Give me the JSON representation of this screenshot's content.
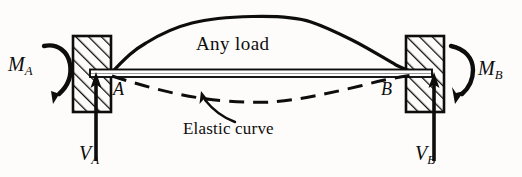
{
  "figure": {
    "ink_color": "#0d0d0d",
    "background_color": "#fdfcfa"
  },
  "labels": {
    "any_load": "Any load",
    "elastic_curve": "Elastic curve",
    "point_a": "A",
    "point_b": "B",
    "moment_a": "M",
    "moment_a_sub": "A",
    "moment_b": "M",
    "moment_b_sub": "B",
    "shear_a": "V",
    "shear_a_sub": "A",
    "shear_b": "V",
    "shear_b_sub": "B"
  },
  "icons": {
    "left_wall": "hatched-support-block-icon",
    "right_wall": "hatched-support-block-icon",
    "moment_a_arc": "curved-moment-arrow-icon",
    "moment_b_arc": "curved-moment-arrow-icon",
    "shear_a_arrow": "up-arrow-icon",
    "shear_b_arrow": "up-arrow-icon",
    "leader_arrow": "leader-arrow-icon",
    "beam": "beam-icon",
    "load_curve": "load-distribution-curve-icon",
    "elastic_curve_dashed": "dashed-deflection-curve-icon"
  },
  "geometry": {
    "beam": {
      "x1": 92,
      "x2": 430,
      "y_top": 69,
      "y_bottom": 77
    },
    "left_block": {
      "x": 73,
      "y": 36,
      "w": 38,
      "h": 76
    },
    "right_block": {
      "x": 406,
      "y": 36,
      "w": 38,
      "h": 76
    },
    "load_curve_points": "110,74 133,52 160,36 188,26 220,20 252,17 286,17 312,23 340,32 368,46 396,62 414,71",
    "elastic_curve_points": "112,75 150,86 190,95 230,100 270,101 310,98 350,90 390,80 412,75",
    "shear_a_arrow": {
      "x": 96,
      "y_tail": 160,
      "y_head": 76
    },
    "shear_b_arrow": {
      "x": 434,
      "y_tail": 160,
      "y_head": 76
    },
    "leader_line": "232,120 214,112 200,104"
  }
}
